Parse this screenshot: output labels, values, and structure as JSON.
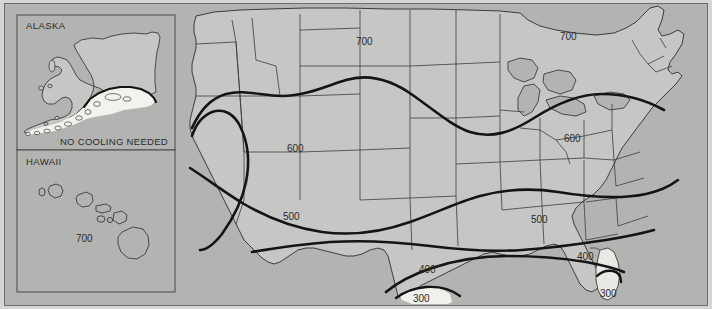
{
  "map": {
    "title": "United States Cooling Contour Map",
    "background_color": "#b3b3b1",
    "land_color": "#c6c6c4",
    "zero_zone_color": "#f2f2ee",
    "contour_color": "#1a1a1a",
    "state_border_color": "#3c3c3c",
    "frame_color": "#6d6d6b"
  },
  "insets": {
    "alaska": {
      "label": "ALASKA",
      "note": "NO COOLING NEEDED"
    },
    "hawaii": {
      "label": "HAWAII",
      "contour_label": "700"
    }
  },
  "contour_labels": [
    {
      "id": "north-plains-700",
      "value": "700",
      "x": 368,
      "y": 41
    },
    {
      "id": "great-lakes-700",
      "value": "700",
      "x": 571,
      "y": 36
    },
    {
      "id": "mountain-600",
      "value": "600",
      "x": 298,
      "y": 148
    },
    {
      "id": "ohio-600",
      "value": "600",
      "x": 575,
      "y": 138
    },
    {
      "id": "southwest-500",
      "value": "500",
      "x": 294,
      "y": 216
    },
    {
      "id": "midsouth-500",
      "value": "500",
      "x": 542,
      "y": 219
    },
    {
      "id": "texas-400",
      "value": "400",
      "x": 430,
      "y": 269
    },
    {
      "id": "gulf-400",
      "value": "400",
      "x": 588,
      "y": 256
    },
    {
      "id": "south-texas-300",
      "value": "300",
      "x": 424,
      "y": 298
    },
    {
      "id": "florida-300",
      "value": "300",
      "x": 611,
      "y": 293
    }
  ],
  "legend": {
    "units_implied": "cooling degree values",
    "values": [
      "300",
      "400",
      "500",
      "600",
      "700"
    ]
  }
}
